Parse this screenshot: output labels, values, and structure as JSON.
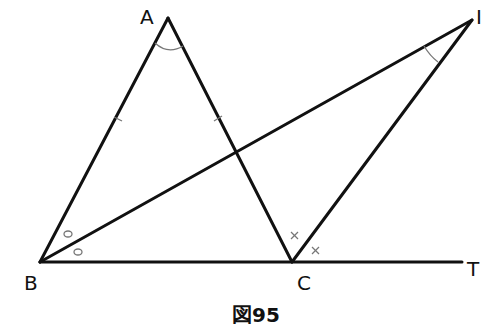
{
  "figure": {
    "caption": "図95",
    "points": {
      "A": {
        "label": "A",
        "x": 168,
        "y": 18
      },
      "B": {
        "label": "B",
        "x": 40,
        "y": 262
      },
      "C": {
        "label": "C",
        "x": 292,
        "y": 262
      },
      "I": {
        "label": "I",
        "x": 472,
        "y": 20
      },
      "T": {
        "label": "T",
        "x": 462,
        "y": 262
      }
    },
    "segments": [
      "AB",
      "AC",
      "BI",
      "CI",
      "BT"
    ],
    "marks": {
      "equal_sides": [
        "AB",
        "AC"
      ],
      "equal_angles_circle": [
        "ABI",
        "IBC"
      ],
      "equal_angles_cross": [
        "ICA",
        "TCI"
      ],
      "angle_arcs": [
        "BAC",
        "BIC"
      ]
    },
    "colors": {
      "line": "#111111",
      "mark": "#777777"
    }
  }
}
